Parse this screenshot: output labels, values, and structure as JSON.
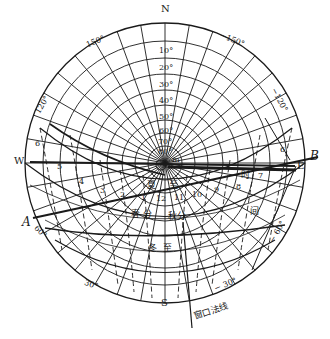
{
  "diagram": {
    "type": "sun-path polar chart with window shading overlay",
    "center": [
      165,
      163
    ],
    "outer_radius": 140,
    "colors": {
      "line": "#1a1a1a",
      "background": "#ffffff"
    }
  },
  "cardinals": {
    "north": "N",
    "south": "S",
    "west": "W",
    "east": "E"
  },
  "altitude_labels": [
    "10°",
    "20°",
    "30°",
    "40°",
    "50°",
    "60°",
    "70°",
    "80°"
  ],
  "azimuth_labels": {
    "a150": "150°",
    "an150": "−150°",
    "a120": "120°",
    "an120": "−120°",
    "a60": "60°",
    "an60": "− 60°",
    "a30": "30°",
    "an30": "− 30°"
  },
  "line_labels": {
    "a": "A",
    "b": "B",
    "m": "m"
  },
  "hour_labels": [
    "6",
    "5",
    "4",
    "3",
    "2",
    "1",
    "12",
    "11",
    "10",
    "9",
    "8",
    "7",
    "6"
  ],
  "season_labels": {
    "summer_solstice_1": "夏",
    "summer_solstice_2": "至",
    "spring_equinox_1": "春",
    "spring_equinox_2": "分",
    "autumn_equinox": "秋分",
    "winter_solstice_1": "冬",
    "winter_solstice_2": "至"
  },
  "time_label": {
    "shi": "时",
    "jian": "间"
  },
  "window_normal_label": "窗口法线"
}
